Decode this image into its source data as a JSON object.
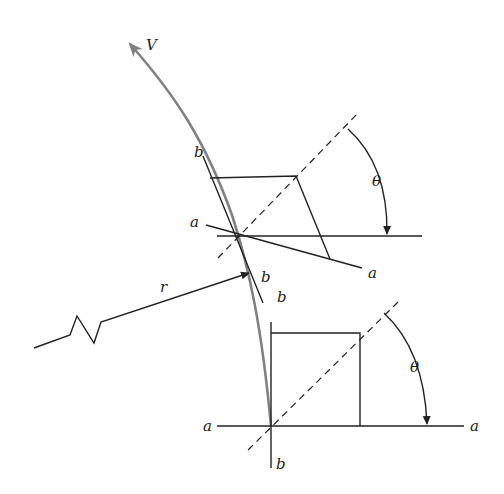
{
  "diagram": {
    "type": "shear-strain element along curved path",
    "labels": {
      "velocity": "V",
      "radius": "r",
      "angle_upper": "θ",
      "angle_lower": "θ",
      "upper_a_left": "a",
      "upper_a_right": "a",
      "upper_b_top": "b",
      "upper_b_bottom": "b",
      "lower_a_left": "a",
      "lower_a_right": "a",
      "lower_b_top": "b",
      "lower_b_bottom": "b"
    },
    "colors": {
      "line": "#222222",
      "curve": "#808080",
      "background": "#ffffff"
    }
  }
}
